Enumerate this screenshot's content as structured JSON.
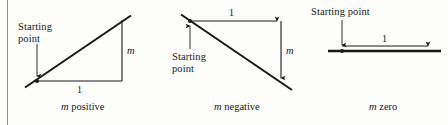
{
  "figure": {
    "background_color": "#fdfdfc",
    "ink_color": "#1a1a1a",
    "rule_color": "#8d8d8d"
  },
  "panels": [
    {
      "id": "m-positive",
      "caption_symbol": "m",
      "caption_word": "positive",
      "start_label_line1": "Starting",
      "start_label_line2": "point",
      "run_label": "1",
      "rise_label": "m",
      "slope_sign": "positive"
    },
    {
      "id": "m-negative",
      "caption_symbol": "m",
      "caption_word": "negative",
      "start_label_line1": "Starting",
      "start_label_line2": "point",
      "run_label": "1",
      "rise_label": "m",
      "slope_sign": "negative"
    },
    {
      "id": "m-zero",
      "caption_symbol": "m",
      "caption_word": "zero",
      "start_label_line1": "Starting point",
      "start_label_line2": "",
      "run_label": "1",
      "rise_label": "",
      "slope_sign": "zero"
    }
  ]
}
